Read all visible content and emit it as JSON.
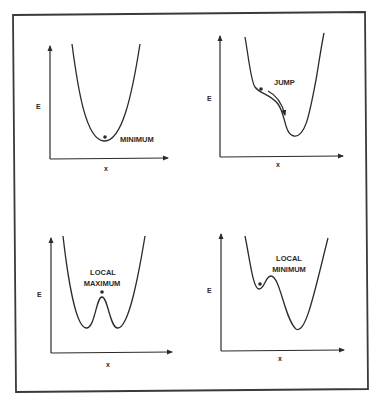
{
  "figure": {
    "panels": [
      {
        "id": "minimum",
        "y_label": "E",
        "x_label": "x",
        "annotation": [
          "MINIMUM"
        ],
        "description": "Single parabolic well with ball at the minimum"
      },
      {
        "id": "jump",
        "y_label": "E",
        "x_label": "x",
        "annotation": [
          "JUMP"
        ],
        "description": "Ball on a shoulder with arrow showing descent into the lower well"
      },
      {
        "id": "local-maximum",
        "y_label": "E",
        "x_label": "x",
        "annotation": [
          "LOCAL",
          "MAXIMUM"
        ],
        "description": "Symmetric double well with ball at central local maximum"
      },
      {
        "id": "local-minimum",
        "y_label": "E",
        "x_label": "x",
        "annotation": [
          "LOCAL",
          "MINIMUM"
        ],
        "description": "Asymmetric double well with ball in shallower local minimum"
      }
    ]
  },
  "colors": {
    "ink": "#2b2b2b",
    "background": "#ffffff"
  }
}
